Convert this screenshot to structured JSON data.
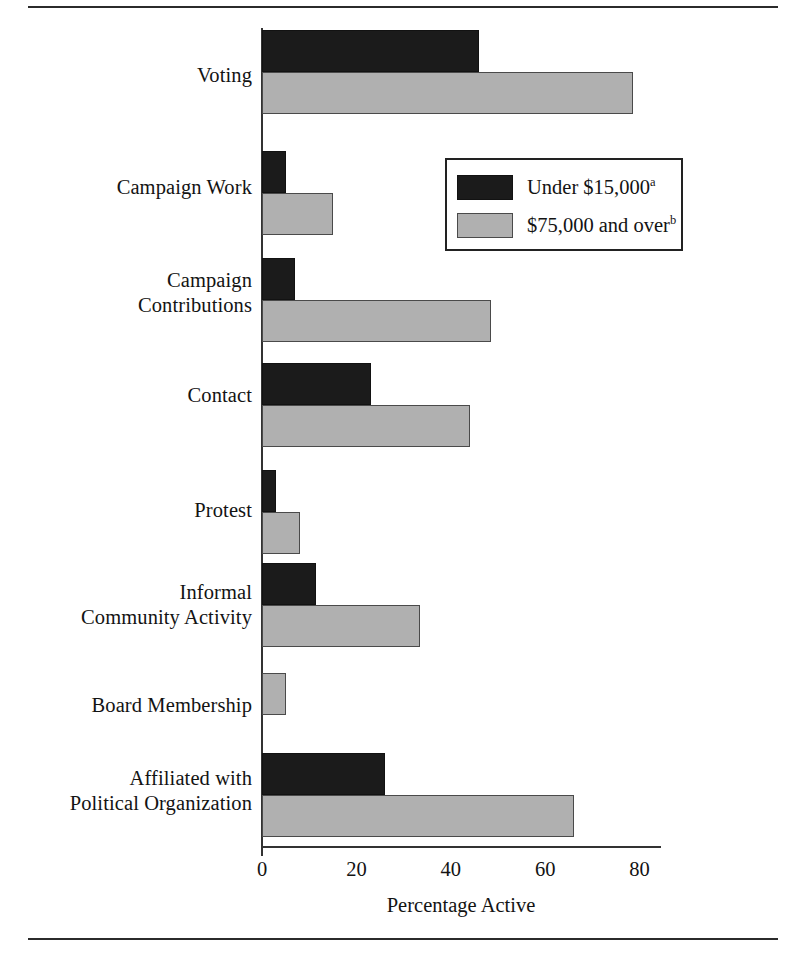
{
  "figure": {
    "rules": {
      "top": true,
      "bottom": true
    }
  },
  "chart_data": {
    "type": "bar",
    "orientation": "horizontal",
    "title": "",
    "xlabel": "Percentage Active",
    "ylabel": "",
    "xlim": [
      0,
      80
    ],
    "xticks": [
      0,
      20,
      40,
      60,
      80
    ],
    "xtick_labels": [
      "0",
      "20",
      "40",
      "60",
      "80"
    ],
    "grid": false,
    "legend_position": "upper right (inside plot)",
    "categories": [
      "Voting",
      "Campaign Work",
      "Campaign\nContributions",
      "Contact",
      "Protest",
      "Informal\nCommunity Activity",
      "Board Membership",
      "Affiliated with\nPolitical Organization"
    ],
    "series": [
      {
        "name": "Under $15,000",
        "footnote": "a",
        "color": "#1b1b1b",
        "values": [
          46,
          5,
          7,
          23,
          3,
          11.5,
          0,
          26
        ]
      },
      {
        "name": "$75,000 and over",
        "footnote": "b",
        "color": "#b0b0b0",
        "values": [
          78.5,
          15,
          48.5,
          44,
          8,
          33.5,
          5,
          66
        ]
      }
    ]
  },
  "categories_display": [
    {
      "lines": [
        "Voting"
      ]
    },
    {
      "lines": [
        "Campaign Work"
      ]
    },
    {
      "lines": [
        "Campaign",
        "Contributions"
      ]
    },
    {
      "lines": [
        "Contact"
      ]
    },
    {
      "lines": [
        "Protest"
      ]
    },
    {
      "lines": [
        "Informal",
        "Community Activity"
      ]
    },
    {
      "lines": [
        "Board Membership"
      ]
    },
    {
      "lines": [
        "Affiliated with",
        "Political Organization"
      ]
    }
  ],
  "legend": {
    "items": [
      {
        "label": "Under $15,000",
        "footnote": "a",
        "swatch": "dark"
      },
      {
        "label": "$75,000 and over",
        "footnote": "b",
        "swatch": "light"
      }
    ]
  },
  "axis": {
    "title": "Percentage Active",
    "tick_labels": [
      "0",
      "20",
      "40",
      "60",
      "80"
    ]
  }
}
